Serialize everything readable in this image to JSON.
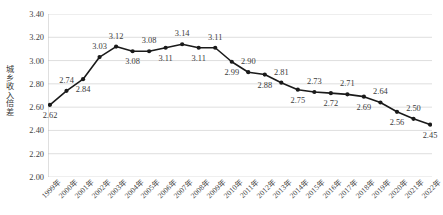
{
  "chart_data": {
    "type": "line",
    "title": "",
    "xlabel": "",
    "ylabel": "城乡收入倍差",
    "ylim": [
      2.0,
      3.4
    ],
    "ytick_labels": [
      "3.40",
      "3.20",
      "3.00",
      "2.80",
      "2.60",
      "2.40",
      "2.20",
      "2.00"
    ],
    "ytick_values": [
      3.4,
      3.2,
      3.0,
      2.8,
      2.6,
      2.4,
      2.2,
      2.0
    ],
    "grid": true,
    "legend": "none",
    "series_color": "#1a1a1a",
    "marker": "circle",
    "categories": [
      "1999年",
      "2000年",
      "2001年",
      "2002年",
      "2003年",
      "2004年",
      "2005年",
      "2006年",
      "2007年",
      "2008年",
      "2009年",
      "2010年",
      "2011年",
      "2012年",
      "2013年",
      "2014年",
      "2015年",
      "2016年",
      "2017年",
      "2018年",
      "2019年",
      "2020年",
      "2021年",
      "2022年"
    ],
    "values": [
      2.62,
      2.74,
      2.84,
      3.03,
      3.12,
      3.08,
      3.08,
      3.11,
      3.14,
      3.11,
      3.11,
      2.99,
      2.9,
      2.88,
      2.81,
      2.75,
      2.73,
      2.72,
      2.71,
      2.69,
      2.64,
      2.56,
      2.5,
      2.45
    ],
    "data_labels": [
      "2.62",
      "2.74",
      "2.84",
      "3.03",
      "3.12",
      "3.08",
      "3.08",
      "3.11",
      "3.14",
      "3.11",
      "3.11",
      "2.99",
      "2.90",
      "2.88",
      "2.81",
      "2.75",
      "2.73",
      "2.72",
      "2.71",
      "2.69",
      "2.64",
      "2.56",
      "2.50",
      "2.45"
    ],
    "label_positions": [
      "below",
      "above",
      "below",
      "above",
      "above",
      "below",
      "above",
      "below",
      "above",
      "below",
      "above",
      "below",
      "above",
      "below",
      "above",
      "below",
      "above",
      "below",
      "above",
      "below",
      "above",
      "below",
      "above",
      "below"
    ]
  }
}
